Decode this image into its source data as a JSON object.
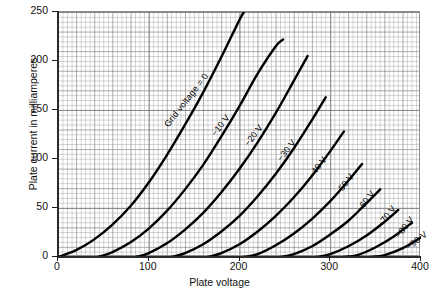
{
  "chart_data": {
    "type": "line",
    "title": "",
    "xlabel": "Plate voltage",
    "ylabel": "Plate current in milliamperes",
    "xlim": [
      0,
      400
    ],
    "ylim": [
      0,
      250
    ],
    "xticks": [
      "0",
      "100",
      "200",
      "300",
      "400"
    ],
    "yticks": [
      "0",
      "50",
      "100",
      "150",
      "200",
      "250"
    ],
    "xtick_values": [
      0,
      100,
      200,
      300,
      400
    ],
    "ytick_values": [
      0,
      50,
      100,
      150,
      200,
      250
    ],
    "grid": true,
    "legend": "none",
    "annotations_inline": true,
    "series": [
      {
        "name": "Grid voltage = 0",
        "label": "Grid voltage = 0",
        "x": [
          0,
          20,
          40,
          60,
          80,
          100,
          120,
          140,
          160,
          180,
          200,
          205
        ],
        "y": [
          0,
          7,
          18,
          33,
          52,
          76,
          104,
          135,
          168,
          204,
          242,
          250
        ]
      },
      {
        "name": "-10 V",
        "label": "−10 V",
        "x": [
          44,
          60,
          80,
          100,
          120,
          140,
          160,
          180,
          200,
          220,
          240,
          248
        ],
        "y": [
          0,
          5,
          15,
          29,
          47,
          69,
          94,
          123,
          154,
          187,
          215,
          222
        ]
      },
      {
        "name": "-20 V",
        "label": "−20 V",
        "x": [
          86,
          100,
          120,
          140,
          160,
          180,
          200,
          220,
          240,
          260,
          275
        ],
        "y": [
          0,
          4,
          14,
          28,
          45,
          66,
          90,
          117,
          147,
          180,
          205
        ]
      },
      {
        "name": "-30 V",
        "label": "−30 V",
        "x": [
          125,
          140,
          160,
          180,
          200,
          220,
          240,
          260,
          280,
          295
        ],
        "y": [
          0,
          4,
          13,
          26,
          42,
          62,
          85,
          111,
          140,
          163
        ]
      },
      {
        "name": "-40 V",
        "label": "−40 V",
        "x": [
          165,
          180,
          200,
          220,
          240,
          260,
          280,
          300,
          315
        ],
        "y": [
          0,
          4,
          13,
          26,
          42,
          61,
          83,
          108,
          128
        ]
      },
      {
        "name": "-50 V",
        "label": "−50 V",
        "x": [
          205,
          220,
          240,
          260,
          280,
          300,
          320,
          335
        ],
        "y": [
          0,
          3,
          12,
          24,
          39,
          57,
          78,
          95
        ]
      },
      {
        "name": "-60 V",
        "label": "−60 V",
        "x": [
          245,
          260,
          280,
          300,
          320,
          340,
          355
        ],
        "y": [
          0,
          3,
          11,
          23,
          37,
          55,
          69
        ]
      },
      {
        "name": "-70 V",
        "label": "−70 V",
        "x": [
          285,
          300,
          320,
          340,
          360,
          375
        ],
        "y": [
          0,
          3,
          11,
          22,
          36,
          48
        ]
      },
      {
        "name": "-80 V",
        "label": "−80 V",
        "x": [
          315,
          330,
          350,
          370,
          390
        ],
        "y": [
          0,
          2,
          10,
          21,
          35
        ]
      },
      {
        "name": "-90 V",
        "label": "−90 V",
        "x": [
          345,
          360,
          380,
          400
        ],
        "y": [
          0,
          2,
          9,
          20
        ]
      }
    ],
    "annotations": [
      {
        "text": "Grid voltage = 0",
        "x": 125,
        "y": 140,
        "angle": -52
      },
      {
        "text": "−10 V",
        "x": 176,
        "y": 131,
        "angle": -52
      },
      {
        "text": "−20 V",
        "x": 213,
        "y": 120,
        "angle": -52
      },
      {
        "text": "−30 V",
        "x": 249,
        "y": 105,
        "angle": -52
      },
      {
        "text": "−40 V",
        "x": 283,
        "y": 88,
        "angle": -52
      },
      {
        "text": "−50 V",
        "x": 313,
        "y": 70,
        "angle": -52
      },
      {
        "text": "−60 V",
        "x": 336,
        "y": 53,
        "angle": -52
      },
      {
        "text": "−70 V",
        "x": 359,
        "y": 38,
        "angle": -52
      },
      {
        "text": "−80 V",
        "x": 379,
        "y": 27,
        "angle": -52
      },
      {
        "text": "−90 V",
        "x": 389,
        "y": 14,
        "angle": -38
      }
    ],
    "style": {
      "curve_color": "#000000",
      "grid_color": "#9b9b9b",
      "axis_color": "#2a2a2a",
      "background": "#ffffff"
    }
  }
}
